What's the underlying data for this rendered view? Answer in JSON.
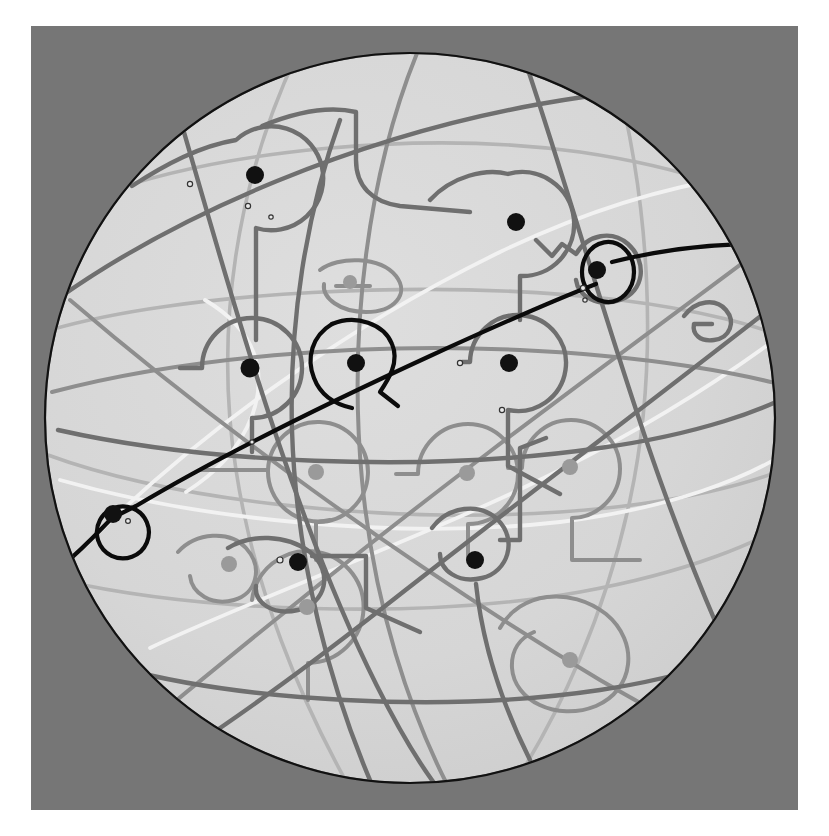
{
  "figure": {
    "canvas": {
      "width": 829,
      "height": 836
    },
    "background_color": "#ffffff",
    "panel_color": "#767676",
    "panel": {
      "x": 31,
      "y": 26,
      "width": 767,
      "height": 784
    },
    "sphere": {
      "center_x": 410,
      "center_y": 418,
      "radius": 365,
      "fill_color": "#d7d7d7",
      "outline_color": "#111111",
      "outline_width": 2.2
    }
  },
  "chart_data": {
    "type": "scatter",
    "xlabel": "",
    "ylabel": "",
    "grid": false,
    "legend": null,
    "xlim": [
      45,
      775
    ],
    "ylim": [
      42,
      795
    ],
    "nodes": [
      {
        "id": "n1",
        "x": 255,
        "y": 175,
        "r": 9,
        "color": "#111111",
        "kind": "marked"
      },
      {
        "id": "n2",
        "x": 516,
        "y": 222,
        "r": 9,
        "color": "#111111",
        "kind": "marked"
      },
      {
        "id": "n3",
        "x": 597,
        "y": 270,
        "r": 9,
        "color": "#111111",
        "kind": "marked"
      },
      {
        "id": "n4",
        "x": 250,
        "y": 368,
        "r": 9.5,
        "color": "#111111",
        "kind": "marked"
      },
      {
        "id": "n5",
        "x": 356,
        "y": 363,
        "r": 9,
        "color": "#111111",
        "kind": "marked"
      },
      {
        "id": "n6",
        "x": 509,
        "y": 363,
        "r": 9,
        "color": "#111111",
        "kind": "marked"
      },
      {
        "id": "n7",
        "x": 113,
        "y": 514,
        "r": 9,
        "color": "#111111",
        "kind": "marked"
      },
      {
        "id": "n8",
        "x": 298,
        "y": 562,
        "r": 9,
        "color": "#111111",
        "kind": "marked"
      },
      {
        "id": "n9",
        "x": 475,
        "y": 560,
        "r": 9,
        "color": "#111111",
        "kind": "marked"
      },
      {
        "id": "n10",
        "x": 316,
        "y": 472,
        "r": 8,
        "color": "#9a9a9a",
        "kind": "back"
      },
      {
        "id": "n11",
        "x": 467,
        "y": 473,
        "r": 8,
        "color": "#9a9a9a",
        "kind": "back"
      },
      {
        "id": "n12",
        "x": 570,
        "y": 467,
        "r": 8,
        "color": "#9a9a9a",
        "kind": "back"
      },
      {
        "id": "n13",
        "x": 229,
        "y": 564,
        "r": 8,
        "color": "#9a9a9a",
        "kind": "back"
      },
      {
        "id": "n14",
        "x": 307,
        "y": 607,
        "r": 8,
        "color": "#9a9a9a",
        "kind": "back"
      },
      {
        "id": "n15",
        "x": 570,
        "y": 660,
        "r": 8,
        "color": "#9a9a9a",
        "kind": "back"
      },
      {
        "id": "n16",
        "x": 350,
        "y": 282,
        "r": 7,
        "color": "#9a9a9a",
        "kind": "back"
      }
    ],
    "tiny_markers": [
      {
        "x": 190,
        "y": 184,
        "r": 2.6
      },
      {
        "x": 248,
        "y": 206,
        "r": 2.6
      },
      {
        "x": 271,
        "y": 217,
        "r": 2.2
      },
      {
        "x": 583,
        "y": 288,
        "r": 2.6
      },
      {
        "x": 585,
        "y": 300,
        "r": 2.2
      },
      {
        "x": 460,
        "y": 363,
        "r": 2.6
      },
      {
        "x": 502,
        "y": 410,
        "r": 2.6
      },
      {
        "x": 252,
        "y": 442,
        "r": 2.2
      },
      {
        "x": 280,
        "y": 560,
        "r": 3.0
      },
      {
        "x": 128,
        "y": 521,
        "r": 2.4
      },
      {
        "x": 505,
        "y": 411,
        "r": 2.2
      }
    ],
    "curve_families": [
      {
        "name": "black-geodesic",
        "color": "#0b0b0b",
        "width": 4.2,
        "count": 1,
        "description": "Dark great circle sweeping from lower-left to upper-right with small loops at nodes n7 and n3."
      },
      {
        "name": "dark-gray-geodesics",
        "color": "#6f6f6f",
        "width": 4.4,
        "count": 4,
        "description": "Medium-dark arcs forming a lattice with rectangular detours around marked nodes."
      },
      {
        "name": "mid-gray-geodesics",
        "color": "#8e8e8e",
        "width": 4.0,
        "count": 4,
        "description": "Mid-gray arcs tracing loops around the shaded back-hemisphere nodes."
      },
      {
        "name": "light-gray-geodesics",
        "color": "#b4b4b4",
        "width": 3.6,
        "count": 4,
        "description": "Faint arcs on the far side of the sphere."
      },
      {
        "name": "white-geodesics",
        "color": "#f2f2f2",
        "width": 3.8,
        "count": 2,
        "description": "Highlight arcs rendered in near-white crossing the upper and middle portions of the disk."
      }
    ]
  }
}
